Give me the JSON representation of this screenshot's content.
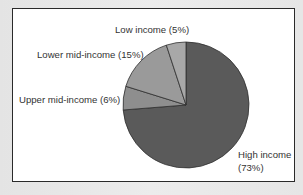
{
  "chart_data": {
    "type": "pie",
    "title": "",
    "start_angle": "12 o'clock",
    "direction": "clockwise",
    "categories": [
      "High income",
      "Upper mid-income",
      "Lower mid-income",
      "Low income"
    ],
    "values": [
      73,
      6,
      15,
      5
    ],
    "unit": "%",
    "colors": [
      "#5a5a5a",
      "#8e8e8e",
      "#9a9a9a",
      "#a8a8a8"
    ],
    "labels": [
      {
        "line1": "High income",
        "line2": "(73%)"
      },
      {
        "line1": "Upper mid-income (6%)"
      },
      {
        "line1": "Lower mid-income (15%)"
      },
      {
        "line1": "Low income (5%)"
      }
    ],
    "legend": "none (direct labels)"
  },
  "labels": {
    "high_line1": "High income",
    "high_line2": "(73%)",
    "upper_mid": "Upper mid-income (6%)",
    "lower_mid": "Lower mid-income (15%)",
    "low": "Low income (5%)"
  }
}
